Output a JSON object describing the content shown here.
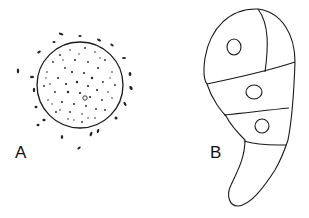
{
  "figure": {
    "panels": [
      {
        "label": "A",
        "description": "Spherical stippled cell with surrounding small particles"
      },
      {
        "label": "B",
        "description": "Elongated comma-shaped multicellular body with three nuclei"
      }
    ]
  },
  "colors": {
    "ink": "#1a1a1a",
    "background": "#ffffff"
  }
}
